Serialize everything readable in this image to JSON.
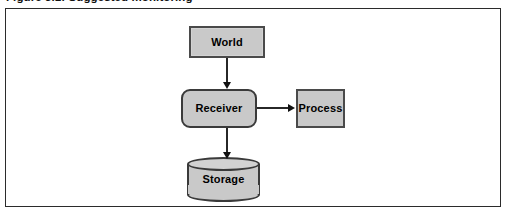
{
  "figure": {
    "caption": "Figure 3.1: Suggested monitoring",
    "frame_border_color": "#2b2b2b",
    "background_color": "#ffffff"
  },
  "diagram": {
    "type": "flow-diagram",
    "node_fill_color": "#c9c9c9",
    "node_border_color": "#3a3a3a",
    "connector_color": "#272727",
    "nodes": [
      {
        "id": "world",
        "label": "World",
        "shape": "rectangle"
      },
      {
        "id": "receiver",
        "label": "Receiver",
        "shape": "rounded-rectangle"
      },
      {
        "id": "process",
        "label": "Process",
        "shape": "rectangle"
      },
      {
        "id": "storage",
        "label": "Storage",
        "shape": "cylinder"
      }
    ],
    "edges": [
      {
        "id": "world-receiver",
        "from": "World",
        "to": "Receiver",
        "direction": "down"
      },
      {
        "id": "receiver-process",
        "from": "Receiver",
        "to": "Process",
        "direction": "right"
      },
      {
        "id": "receiver-storage",
        "from": "Receiver",
        "to": "Storage",
        "direction": "down"
      }
    ]
  }
}
